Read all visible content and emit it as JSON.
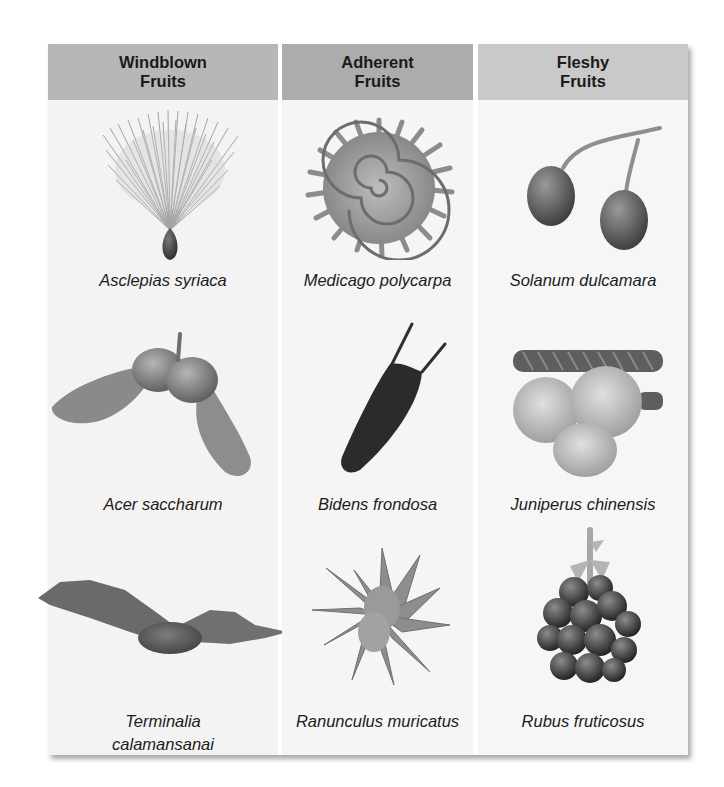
{
  "colors": {
    "header_windblown": "#b7b7b7",
    "header_adherent": "#acacac",
    "header_fleshy": "#c9c9c9",
    "panel_bg": "#f4f4f4",
    "text": "#1a1a1a"
  },
  "columns": [
    {
      "header": "Windblown\nFruits",
      "fruits": [
        {
          "name": "Asclepias syriaca",
          "icon": "tufted-seed-icon"
        },
        {
          "name": "Acer saccharum",
          "icon": "winged-samara-icon"
        },
        {
          "name": "Terminalia\ncalamansanai",
          "icon": "winged-fruit-icon"
        }
      ]
    },
    {
      "header": "Adherent\nFruits",
      "fruits": [
        {
          "name": "Medicago polycarpa",
          "icon": "spiral-burr-icon"
        },
        {
          "name": "Bidens frondosa",
          "icon": "barbed-achene-icon"
        },
        {
          "name": "Ranunculus muricatus",
          "icon": "spiny-star-achene-icon"
        }
      ]
    },
    {
      "header": "Fleshy\nFruits",
      "fruits": [
        {
          "name": "Solanum dulcamara",
          "icon": "berry-pair-icon"
        },
        {
          "name": "Juniperus chinensis",
          "icon": "juniper-cone-icon"
        },
        {
          "name": "Rubus fruticosus",
          "icon": "blackberry-icon"
        }
      ]
    }
  ]
}
